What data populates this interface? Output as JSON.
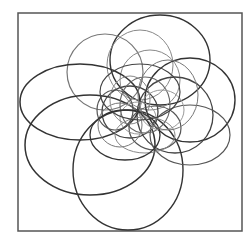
{
  "figure": {
    "frame": {
      "x": 18,
      "y": 13,
      "width": 224,
      "height": 218,
      "stroke": "#555555"
    },
    "ellipses": [
      {
        "cx": 160,
        "cy": 60,
        "rx": 50,
        "ry": 45,
        "stroke": "#333333",
        "width": 1.4
      },
      {
        "cx": 105,
        "cy": 72,
        "rx": 38,
        "ry": 38,
        "stroke": "#777777",
        "width": 1.2
      },
      {
        "cx": 140,
        "cy": 65,
        "rx": 33,
        "ry": 35,
        "stroke": "#888888",
        "width": 1.0
      },
      {
        "cx": 150,
        "cy": 80,
        "rx": 30,
        "ry": 30,
        "stroke": "#888888",
        "width": 1.0
      },
      {
        "cx": 190,
        "cy": 100,
        "rx": 45,
        "ry": 42,
        "stroke": "#333333",
        "width": 1.4
      },
      {
        "cx": 175,
        "cy": 115,
        "rx": 38,
        "ry": 38,
        "stroke": "#444444",
        "width": 1.3
      },
      {
        "cx": 80,
        "cy": 102,
        "rx": 60,
        "ry": 38,
        "stroke": "#333333",
        "width": 1.5
      },
      {
        "cx": 90,
        "cy": 145,
        "rx": 65,
        "ry": 50,
        "stroke": "#333333",
        "width": 1.5
      },
      {
        "cx": 128,
        "cy": 170,
        "rx": 55,
        "ry": 60,
        "stroke": "#333333",
        "width": 1.4
      },
      {
        "cx": 190,
        "cy": 135,
        "rx": 40,
        "ry": 30,
        "stroke": "#555555",
        "width": 1.2
      },
      {
        "cx": 130,
        "cy": 112,
        "rx": 28,
        "ry": 26,
        "stroke": "#444444",
        "width": 1.3
      },
      {
        "cx": 145,
        "cy": 105,
        "rx": 25,
        "ry": 28,
        "stroke": "#666666",
        "width": 1.1
      },
      {
        "cx": 120,
        "cy": 125,
        "rx": 22,
        "ry": 22,
        "stroke": "#777777",
        "width": 1.0
      },
      {
        "cx": 155,
        "cy": 128,
        "rx": 26,
        "ry": 22,
        "stroke": "#555555",
        "width": 1.2
      },
      {
        "cx": 138,
        "cy": 118,
        "rx": 18,
        "ry": 16,
        "stroke": "#999999",
        "width": 1.0
      },
      {
        "cx": 130,
        "cy": 100,
        "rx": 20,
        "ry": 24,
        "stroke": "#888888",
        "width": 1.0
      },
      {
        "cx": 162,
        "cy": 110,
        "rx": 22,
        "ry": 20,
        "stroke": "#999999",
        "width": 1.0
      },
      {
        "cx": 115,
        "cy": 110,
        "rx": 18,
        "ry": 20,
        "stroke": "#555555",
        "width": 1.2
      },
      {
        "cx": 145,
        "cy": 135,
        "rx": 30,
        "ry": 18,
        "stroke": "#888888",
        "width": 1.0
      },
      {
        "cx": 140,
        "cy": 92,
        "rx": 40,
        "ry": 28,
        "stroke": "#444444",
        "width": 1.2
      },
      {
        "cx": 125,
        "cy": 135,
        "rx": 35,
        "ry": 25,
        "stroke": "#333333",
        "width": 1.3
      },
      {
        "cx": 168,
        "cy": 95,
        "rx": 30,
        "ry": 35,
        "stroke": "#777777",
        "width": 1.0
      }
    ]
  }
}
